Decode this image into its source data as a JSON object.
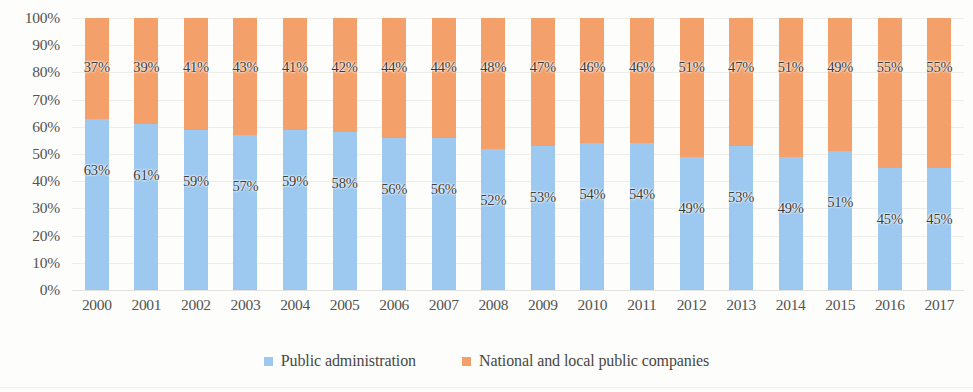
{
  "chart_data": {
    "type": "bar",
    "subtype": "100% stacked column",
    "title": "",
    "subtitle": "",
    "xlabel": "",
    "ylabel": "",
    "ylim": [
      0,
      100
    ],
    "y_unit": "%",
    "grid": true,
    "legend_position": "bottom",
    "categories": [
      "2000",
      "2001",
      "2002",
      "2003",
      "2004",
      "2005",
      "2006",
      "2007",
      "2008",
      "2009",
      "2010",
      "2011",
      "2012",
      "2013",
      "2014",
      "2015",
      "2016",
      "2017"
    ],
    "ytick_labels": [
      "100%",
      "90%",
      "80%",
      "70%",
      "60%",
      "50%",
      "40%",
      "30%",
      "20%",
      "10%",
      "0%"
    ],
    "ytick_values": [
      100,
      90,
      80,
      70,
      60,
      50,
      40,
      30,
      20,
      10,
      0
    ],
    "series": [
      {
        "name": "Public administration",
        "color": "#9dc8ef",
        "values": [
          63,
          61,
          59,
          57,
          59,
          58,
          56,
          56,
          52,
          53,
          54,
          54,
          49,
          53,
          49,
          51,
          45,
          45
        ],
        "labels": [
          "63%",
          "61%",
          "59%",
          "57%",
          "59%",
          "58%",
          "56%",
          "56%",
          "52%",
          "53%",
          "54%",
          "54%",
          "49%",
          "53%",
          "49%",
          "51%",
          "45%",
          "45%"
        ]
      },
      {
        "name": "National and local public companies",
        "color": "#f4a06a",
        "values": [
          37,
          39,
          41,
          43,
          41,
          42,
          44,
          44,
          48,
          47,
          46,
          46,
          51,
          47,
          51,
          49,
          55,
          55
        ],
        "labels": [
          "37%",
          "39%",
          "41%",
          "43%",
          "41%",
          "42%",
          "44%",
          "44%",
          "48%",
          "47%",
          "46%",
          "46%",
          "51%",
          "47%",
          "51%",
          "49%",
          "55%",
          "55%"
        ]
      }
    ],
    "column_totals": [
      100,
      100,
      100,
      100,
      100,
      100,
      100,
      100,
      100,
      100,
      100,
      100,
      100,
      100,
      100,
      100,
      100,
      100
    ]
  },
  "legend": {
    "items": [
      {
        "label": "Public administration",
        "color": "#9dc8ef"
      },
      {
        "label": "National and local public companies",
        "color": "#f4a06a"
      }
    ]
  },
  "colors": {
    "series_blue": "#9dc8ef",
    "series_orange": "#f4a06a",
    "gridline": "#ededea",
    "axis_text": "#54534f",
    "label_text": "#3a3a38",
    "background": "#fdfdfc"
  }
}
